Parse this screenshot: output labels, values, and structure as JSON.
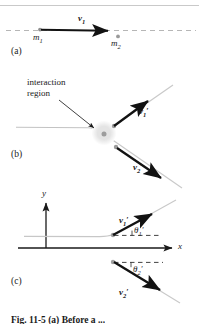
{
  "figure": {
    "title_caption": "Fig. 11-5 (a) Before a ...",
    "kind": "physics-collision-diagram",
    "colors": {
      "ink": "#1a1a1a",
      "vector_arrow": "#121212",
      "guide_line": "#b9b9b9",
      "dashed_line": "#b0b0b0",
      "blob_fill": "#e6e6e6",
      "particle_dot": "#9a9a9a",
      "axis": "#1a1a1a",
      "top_rule": "#c9c9c9"
    }
  },
  "panels": [
    {
      "tag": "(a)",
      "name": "before-collision",
      "labels": {
        "m1": "m",
        "m1_sub": "1",
        "m2": "m",
        "m2_sub": "2",
        "v1": "v",
        "v1_sub": "1"
      }
    },
    {
      "tag": "(b)",
      "name": "during-and-after-collision",
      "labels": {
        "interaction_line1": "interaction",
        "interaction_line2": "region",
        "v1p": "v",
        "v1p_sub": "1",
        "v1p_prime": "′",
        "v2p": "v",
        "v2p_sub": "2",
        "v2p_prime": "′"
      }
    },
    {
      "tag": "(c)",
      "name": "scattering-angles",
      "labels": {
        "axis_x": "x",
        "axis_y": "y",
        "v1p": "v",
        "v1p_sub": "1",
        "v1p_prime": "′",
        "v2p": "v",
        "v2p_sub": "2",
        "v2p_prime": "′",
        "theta1": "θ",
        "theta1_sub": "1",
        "theta1_prime": "′",
        "theta2": "θ",
        "theta2_sub": "2",
        "theta2_prime": "′"
      }
    }
  ],
  "geometry": {
    "panel_a": {
      "dashed_y": 30,
      "m1_dot": [
        40,
        30
      ],
      "m2_dot": [
        118,
        36
      ],
      "arrow_from": [
        41,
        30
      ],
      "arrow_to": [
        112,
        31
      ]
    },
    "panel_b": {
      "blob_center": [
        104,
        133
      ],
      "blob_radius": 12,
      "center_dot": [
        104,
        134
      ],
      "incoming_from": [
        18,
        127
      ],
      "incoming_to": [
        100,
        131
      ],
      "out1_from": [
        113,
        126
      ],
      "out1_to": [
        152,
        98
      ],
      "out2_from": [
        113,
        148
      ],
      "out2_to": [
        166,
        176
      ]
    },
    "panel_c": {
      "origin": [
        46,
        248
      ],
      "x_axis_end": [
        176,
        248
      ],
      "y_axis_top": [
        46,
        200
      ],
      "p1_node": [
        113,
        235
      ],
      "p2_node": [
        113,
        262
      ],
      "out1_to": [
        157,
        212
      ],
      "out2_to": [
        166,
        294
      ]
    }
  }
}
